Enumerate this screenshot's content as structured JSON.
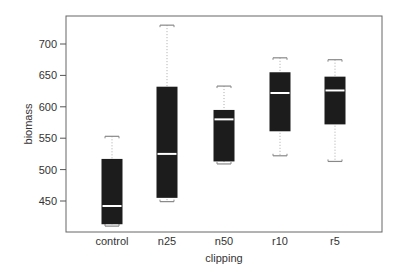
{
  "chart_data": {
    "type": "box",
    "title": "",
    "xlabel": "clipping",
    "ylabel": "biomass",
    "categories": [
      "control",
      "n25",
      "n50",
      "r10",
      "r5"
    ],
    "yticks": [
      450,
      500,
      550,
      600,
      650,
      700
    ],
    "ylim": [
      400,
      745
    ],
    "grid": false,
    "legend": null,
    "boxes": [
      {
        "label": "control",
        "min": 410,
        "q1": 413,
        "median": 442,
        "q3": 517,
        "max": 553
      },
      {
        "label": "n25",
        "min": 449,
        "q1": 455,
        "median": 525,
        "q3": 632,
        "max": 730
      },
      {
        "label": "n50",
        "min": 509,
        "q1": 513,
        "median": 580,
        "q3": 595,
        "max": 633
      },
      {
        "label": "r10",
        "min": 522,
        "q1": 561,
        "median": 622,
        "q3": 655,
        "max": 678
      },
      {
        "label": "r5",
        "min": 513,
        "q1": 572,
        "median": 626,
        "q3": 648,
        "max": 675
      }
    ],
    "colors": {
      "box_fill": "#1c1c1c",
      "median": "#ffffff",
      "whisker": "#999999",
      "axis": "#555555"
    }
  }
}
